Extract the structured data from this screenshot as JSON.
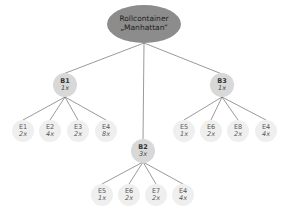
{
  "root": {
    "line1": "Rollcontainer",
    "line2": "„Manhattan“",
    "color": "#8c8c8c"
  },
  "assemblies": [
    {
      "label": "B1",
      "qty": "1x",
      "children": [
        {
          "label": "E1",
          "qty": "2x"
        },
        {
          "label": "E2",
          "qty": "4x"
        },
        {
          "label": "E3",
          "qty": "2x"
        },
        {
          "label": "E4",
          "qty": "8x"
        }
      ]
    },
    {
      "label": "B2",
      "qty": "3x",
      "children": [
        {
          "label": "E5",
          "qty": "1x"
        },
        {
          "label": "E6",
          "qty": "2x"
        },
        {
          "label": "E7",
          "qty": "2x"
        },
        {
          "label": "E4",
          "qty": "4x"
        }
      ]
    },
    {
      "label": "B3",
      "qty": "1x",
      "children": [
        {
          "label": "E5",
          "qty": "1x"
        },
        {
          "label": "E6",
          "qty": "2x"
        },
        {
          "label": "E8",
          "qty": "2x"
        },
        {
          "label": "E4",
          "qty": "4x"
        }
      ]
    }
  ]
}
